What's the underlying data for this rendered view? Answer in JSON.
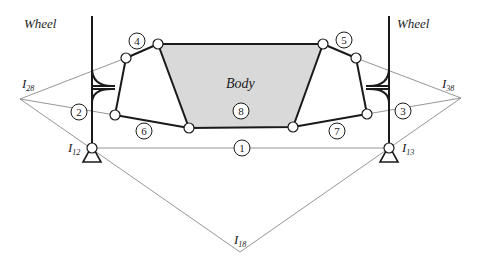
{
  "labels": {
    "wheel_left": "Wheel",
    "wheel_right": "Wheel",
    "body": "Body",
    "I28": {
      "main": "I",
      "sub": "28"
    },
    "I38": {
      "main": "I",
      "sub": "38"
    },
    "I12": {
      "main": "I",
      "sub": "12"
    },
    "I13": {
      "main": "I",
      "sub": "13"
    },
    "I18": {
      "main": "I",
      "sub": "18"
    }
  },
  "link_numbers": [
    "1",
    "2",
    "3",
    "4",
    "5",
    "6",
    "7",
    "8"
  ],
  "colors": {
    "body_fill": "#d9d9d9",
    "line": "#1a1a1a",
    "construction_line": "#8a8a8a"
  }
}
